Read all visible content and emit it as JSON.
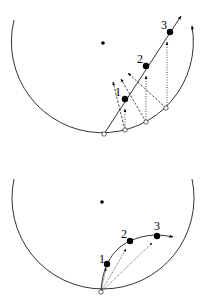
{
  "colors": {
    "ink": "#000000",
    "background": "#ffffff"
  },
  "top_diagram": {
    "description": "Straight-line trajectory with points projected from circle",
    "points": [
      {
        "label": "1"
      },
      {
        "label": "2"
      },
      {
        "label": "3"
      }
    ]
  },
  "bottom_diagram": {
    "description": "Curved trajectory with chords from circle bottom",
    "points": [
      {
        "label": "1"
      },
      {
        "label": "2"
      },
      {
        "label": "3"
      }
    ]
  }
}
